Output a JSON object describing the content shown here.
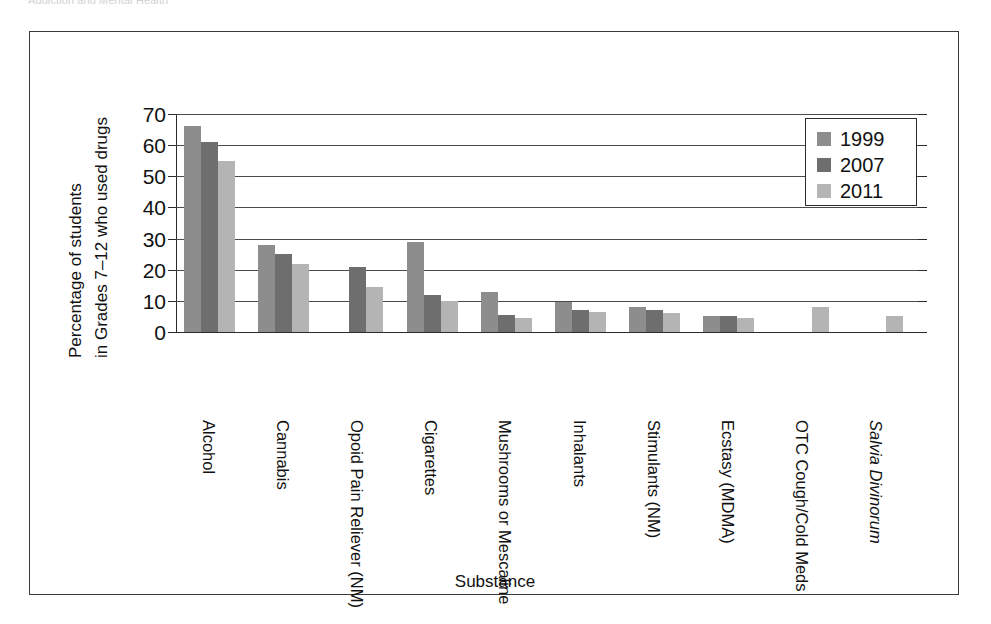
{
  "page": {
    "running_header": "Addiction and Mental Health"
  },
  "bleed_text": {
    "right_top": "Canadian Student Tobacco, Alcohol and Drugs Survey"
  },
  "chart_data": {
    "type": "bar",
    "title": "",
    "xlabel": "Substance",
    "ylabel_line1": "Percentage of students",
    "ylabel_line2": "in Grades 7–12 who used drugs",
    "ylim": [
      0,
      70
    ],
    "yticks": [
      0,
      10,
      20,
      30,
      40,
      50,
      60,
      70
    ],
    "grid": true,
    "legend_position": "top-right",
    "categories": [
      "Alcohol",
      "Cannabis",
      "Opoid Pain Reliever (NM)",
      "Cigarettes",
      "Mushrooms or Mescaline",
      "Inhalants",
      "Stimulants (NM)",
      "Ecstasy (MDMA)",
      "OTC Cough/Cold Meds",
      "Salvia Divinorum"
    ],
    "categories_italic": [
      false,
      false,
      false,
      false,
      false,
      false,
      false,
      false,
      false,
      true
    ],
    "series": [
      {
        "name": "1999",
        "color": "#8d8d8d",
        "values": [
          66,
          28,
          null,
          29,
          13,
          9.5,
          8,
          5,
          null,
          null
        ]
      },
      {
        "name": "2007",
        "color": "#6e6e6e",
        "values": [
          61,
          25,
          21,
          12,
          5.5,
          7,
          7,
          5,
          null,
          null
        ]
      },
      {
        "name": "2011",
        "color": "#b4b4b4",
        "values": [
          55,
          22,
          14.5,
          10,
          4.5,
          6.5,
          6,
          4.5,
          8,
          5
        ]
      }
    ]
  }
}
